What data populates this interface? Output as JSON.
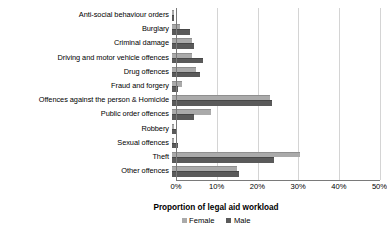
{
  "chart_data": {
    "type": "bar",
    "orientation": "horizontal",
    "title": "",
    "xlabel": "Proportion of legal aid workload",
    "ylabel": "",
    "xlim": [
      0,
      50
    ],
    "xticks": [
      "0%",
      "10%",
      "20%",
      "30%",
      "40%",
      "50%"
    ],
    "xtick_values": [
      0,
      10,
      20,
      30,
      40,
      50
    ],
    "grid": true,
    "legend_position": "bottom",
    "categories": [
      "Anti-social behaviour orders",
      "Burglary",
      "Criminal damage",
      "Driving and motor vehicle offences",
      "Drug offences",
      "Fraud and forgery",
      "Offences against the person & Homicide",
      "Public order offences",
      "Robbery",
      "Sexual offences",
      "Theft",
      "Other offences"
    ],
    "series": [
      {
        "name": "Female",
        "color": "#aaaaaa",
        "values": [
          0.5,
          2.0,
          5.0,
          5.0,
          6.0,
          2.5,
          24.0,
          9.5,
          0.4,
          0.5,
          31.5,
          16.0
        ]
      },
      {
        "name": "Male",
        "color": "#5a5a5a",
        "values": [
          0.6,
          4.5,
          5.5,
          7.5,
          7.0,
          1.5,
          24.5,
          5.5,
          1.2,
          1.5,
          25.0,
          16.5
        ]
      }
    ]
  },
  "legend": {
    "items": [
      {
        "label": "Female",
        "color": "#aaaaaa"
      },
      {
        "label": "Male",
        "color": "#5a5a5a"
      }
    ]
  }
}
